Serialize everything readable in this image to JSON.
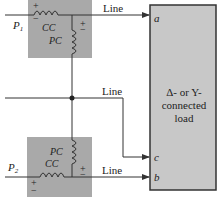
{
  "diagram": {
    "wattmeters": [
      {
        "label": "P1",
        "sub": "1",
        "current_coil": "CC",
        "potential_coil": "PC",
        "polarity_cc": "+",
        "polarity_cc_minus": "−",
        "polarity_pc": "+",
        "polarity_pc_minus": "−"
      },
      {
        "label": "P2",
        "sub": "2",
        "current_coil": "CC",
        "potential_coil": "PC",
        "polarity_cc": "+",
        "polarity_cc_minus": "−",
        "polarity_pc": "+",
        "polarity_pc_minus": "−"
      }
    ],
    "lines": [
      {
        "label": "Line",
        "terminal": "a"
      },
      {
        "label": "Line",
        "terminal": "c"
      },
      {
        "label": "Line",
        "terminal": "b"
      }
    ],
    "load": {
      "line1": "Δ- or Y-",
      "line2": "connected",
      "line3": "load"
    },
    "colors": {
      "meter_fill": "#a9a9a9",
      "load_fill": "#c8c8c8",
      "wire": "#333333"
    }
  }
}
